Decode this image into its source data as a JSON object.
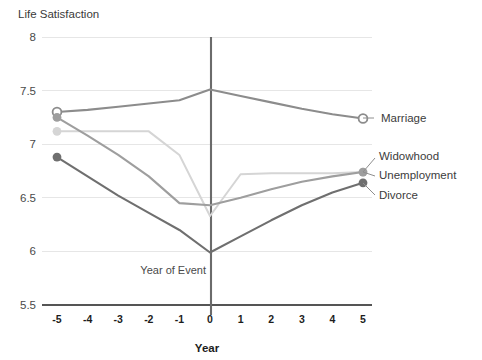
{
  "chart_data": {
    "type": "line",
    "title": "",
    "ylabel": "Life Satisfaction",
    "xlabel": "Year",
    "x": [
      -5,
      -4,
      -3,
      -2,
      -1,
      0,
      1,
      2,
      3,
      4,
      5
    ],
    "xtick_labels": [
      "-5",
      "-4",
      "-3",
      "-2",
      "-1",
      "0",
      "1",
      "2",
      "3",
      "4",
      "5"
    ],
    "ytick_labels": [
      "8",
      "7.5",
      "7",
      "6.5",
      "6",
      "5.5"
    ],
    "yticks": [
      8,
      7.5,
      7,
      6.5,
      6,
      5.5
    ],
    "ylim": [
      5.5,
      8
    ],
    "xlim": [
      -5,
      5
    ],
    "grid": "horizontal",
    "legend_position": "right-inline",
    "annotations": [
      {
        "text": "Year of Event",
        "x": 0,
        "y": 6.05,
        "description": "vertical reference line at year 0"
      }
    ],
    "series": [
      {
        "name": "Marriage",
        "color": "#8c8c8c",
        "marker": "open-circle",
        "values": [
          7.3,
          7.32,
          7.35,
          7.38,
          7.41,
          7.51,
          7.45,
          7.39,
          7.33,
          7.28,
          7.24
        ]
      },
      {
        "name": "Widowhood",
        "color": "#d5d5d5",
        "marker": "filled-circle",
        "values": [
          7.12,
          7.12,
          7.12,
          7.12,
          6.9,
          6.33,
          6.72,
          6.73,
          6.73,
          6.73,
          6.74
        ]
      },
      {
        "name": "Unemployment",
        "color": "#9e9e9e",
        "marker": "filled-circle",
        "values": [
          7.25,
          7.08,
          6.9,
          6.7,
          6.45,
          6.43,
          6.5,
          6.58,
          6.65,
          6.7,
          6.74
        ]
      },
      {
        "name": "Divorce",
        "color": "#6f6f6f",
        "marker": "filled-circle",
        "values": [
          6.88,
          6.7,
          6.52,
          6.36,
          6.2,
          5.99,
          6.14,
          6.29,
          6.43,
          6.55,
          6.64
        ]
      }
    ]
  },
  "legend": {
    "items": [
      {
        "label": "Marriage"
      },
      {
        "label": "Widowhood"
      },
      {
        "label": "Unemployment"
      },
      {
        "label": "Divorce"
      }
    ]
  },
  "colors": {
    "marriage": "#8c8c8c",
    "widowhood": "#d5d5d5",
    "unemployment": "#9e9e9e",
    "divorce": "#6f6f6f",
    "grid": "#e6e6e6",
    "axis": "#555555",
    "event_line": "#6b6b6b"
  }
}
